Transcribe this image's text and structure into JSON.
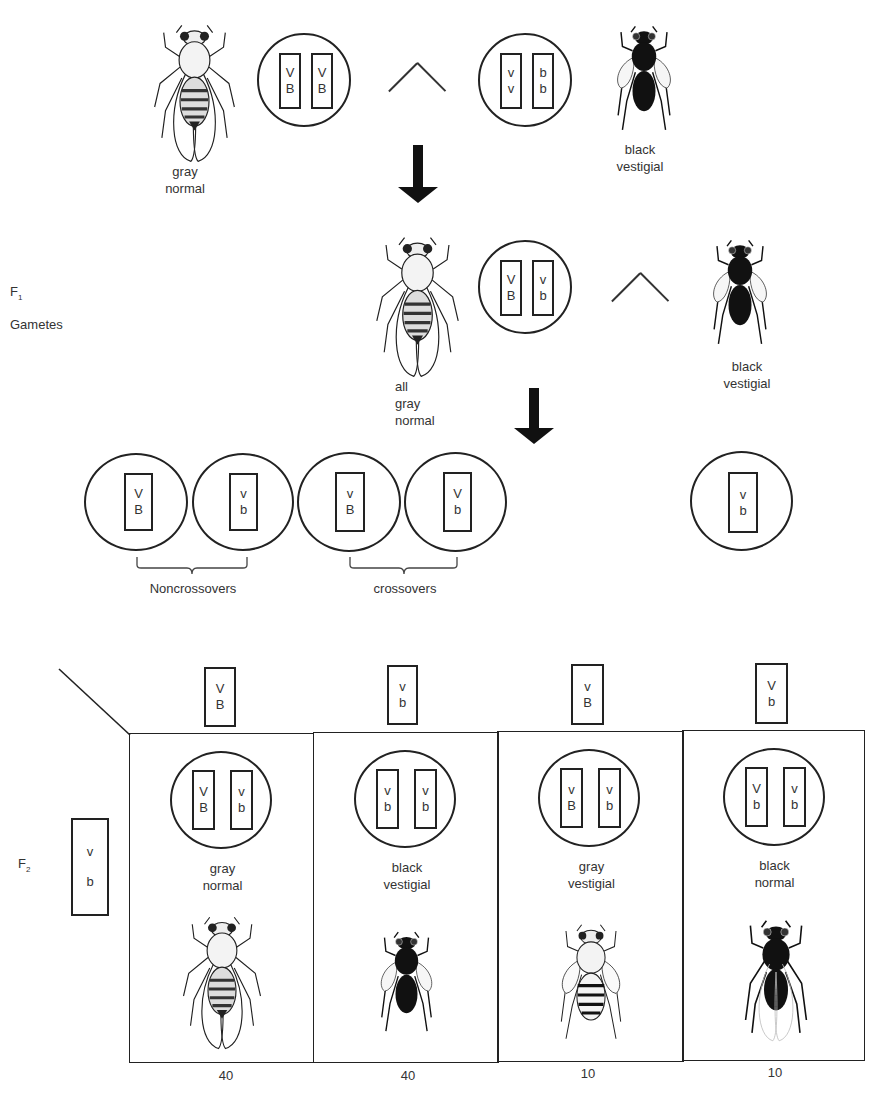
{
  "parents": {
    "left": {
      "phenotype": [
        "gray",
        "normal"
      ],
      "chromosomes": [
        [
          "V",
          "B"
        ],
        [
          "V",
          "B"
        ]
      ]
    },
    "cross_symbol": "×",
    "right": {
      "phenotype": [
        "black",
        "vestigial"
      ],
      "chromosomes": [
        [
          "v",
          "v"
        ],
        [
          "b",
          "b"
        ]
      ]
    }
  },
  "f1": {
    "generation_label": "F",
    "generation_sub": "1",
    "gametes_label": "Gametes",
    "left": {
      "phenotype": [
        "all",
        "gray",
        "normal"
      ],
      "chromosomes": [
        [
          "V",
          "B"
        ],
        [
          "v",
          "b"
        ]
      ]
    },
    "cross_symbol": "×",
    "right": {
      "phenotype": [
        "black",
        "vestigial"
      ]
    }
  },
  "gametes": {
    "items": [
      {
        "alleles": [
          "V",
          "B"
        ]
      },
      {
        "alleles": [
          "v",
          "b"
        ]
      },
      {
        "alleles": [
          "v",
          "B"
        ]
      },
      {
        "alleles": [
          "V",
          "b"
        ]
      }
    ],
    "right_gamete": {
      "alleles": [
        "v",
        "b"
      ]
    },
    "noncrossovers_label": "Noncrossovers",
    "crossovers_label": "crossovers"
  },
  "f2": {
    "generation_label": "F",
    "generation_sub": "2",
    "row_gamete": {
      "alleles": [
        "v",
        "b"
      ]
    },
    "columns": [
      {
        "gamete": [
          "V",
          "B"
        ],
        "genotype": [
          [
            "V",
            "B"
          ],
          [
            "v",
            "b"
          ]
        ],
        "phenotype": [
          "gray",
          "normal"
        ],
        "count": "40",
        "fly": "gray-normal"
      },
      {
        "gamete": [
          "v",
          "b"
        ],
        "genotype": [
          [
            "v",
            "b"
          ],
          [
            "v",
            "b"
          ]
        ],
        "phenotype": [
          "black",
          "vestigial"
        ],
        "count": "40",
        "fly": "black-vestigial"
      },
      {
        "gamete": [
          "v",
          "B"
        ],
        "genotype": [
          [
            "v",
            "B"
          ],
          [
            "v",
            "b"
          ]
        ],
        "phenotype": [
          "gray",
          "vestigial"
        ],
        "count": "10",
        "fly": "gray-vestigial"
      },
      {
        "gamete": [
          "V",
          "b"
        ],
        "genotype": [
          [
            "V",
            "b"
          ],
          [
            "v",
            "b"
          ]
        ],
        "phenotype": [
          "black",
          "normal"
        ],
        "count": "10",
        "fly": "black-normal"
      }
    ]
  },
  "colors": {
    "ink": "#222222",
    "background": "#ffffff"
  }
}
